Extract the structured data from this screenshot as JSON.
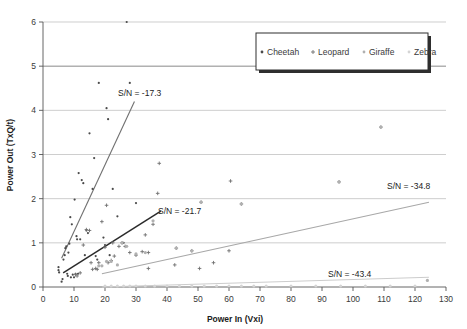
{
  "chart_data": {
    "type": "scatter",
    "title": "",
    "xlabel": "Power In (Vxi)",
    "ylabel": "Power Out (TxQ/t)",
    "xlim": [
      0,
      130
    ],
    "ylim": [
      0,
      6
    ],
    "xticks": [
      0,
      10,
      20,
      30,
      40,
      50,
      60,
      70,
      80,
      90,
      100,
      110,
      120,
      130
    ],
    "yticks": [
      0,
      1,
      2,
      3,
      4,
      5,
      6
    ],
    "grid": "horizontal",
    "legend_position": "top-right",
    "legend_entries": [
      "Cheetah",
      "Leopard",
      "Giraffe",
      "Zebra"
    ],
    "series": [
      {
        "name": "Cheetah",
        "color": "#4a4a4a",
        "marker": "dot",
        "points": [
          [
            5.0,
            0.38
          ],
          [
            5.0,
            0.45
          ],
          [
            5.2,
            0.33
          ],
          [
            6.0,
            0.12
          ],
          [
            6.3,
            0.18
          ],
          [
            6.6,
            0.62
          ],
          [
            7.0,
            0.72
          ],
          [
            7.2,
            0.88
          ],
          [
            7.5,
            0.92
          ],
          [
            7.8,
            0.3
          ],
          [
            8.0,
            0.25
          ],
          [
            8.2,
            0.78
          ],
          [
            8.5,
            0.98
          ],
          [
            8.8,
            1.58
          ],
          [
            9.0,
            0.22
          ],
          [
            9.3,
            1.42
          ],
          [
            9.6,
            0.28
          ],
          [
            10.0,
            0.22
          ],
          [
            10.2,
            1.98
          ],
          [
            10.5,
            0.3
          ],
          [
            10.8,
            1.15
          ],
          [
            11.0,
            1.08
          ],
          [
            11.3,
            0.3
          ],
          [
            11.5,
            2.58
          ],
          [
            12.0,
            1.08
          ],
          [
            12.5,
            2.42
          ],
          [
            13.0,
            2.35
          ],
          [
            13.5,
            0.72
          ],
          [
            14.0,
            1.28
          ],
          [
            14.5,
            1.22
          ],
          [
            15.0,
            3.48
          ],
          [
            16.0,
            2.22
          ],
          [
            16.5,
            2.92
          ],
          [
            17.0,
            0.7
          ],
          [
            17.5,
            0.62
          ],
          [
            18.0,
            4.62
          ],
          [
            19.5,
            1.12
          ],
          [
            20.0,
            0.95
          ],
          [
            20.5,
            4.05
          ],
          [
            21.0,
            3.8
          ],
          [
            21.5,
            0.72
          ],
          [
            22.5,
            2.22
          ],
          [
            24.0,
            1.6
          ],
          [
            26.0,
            1.0
          ],
          [
            27.0,
            6.0
          ],
          [
            28.0,
            4.62
          ],
          [
            30.0,
            1.9
          ]
        ]
      },
      {
        "name": "Leopard",
        "color": "#6f6f6f",
        "marker": "cross",
        "points": [
          [
            10.5,
            0.28
          ],
          [
            11.0,
            0.25
          ],
          [
            12.0,
            0.32
          ],
          [
            13.0,
            0.95
          ],
          [
            14.0,
            1.3
          ],
          [
            15.0,
            1.28
          ],
          [
            15.5,
            0.55
          ],
          [
            16.0,
            0.4
          ],
          [
            17.0,
            0.42
          ],
          [
            17.5,
            0.4
          ],
          [
            18.0,
            0.55
          ],
          [
            19.0,
            1.48
          ],
          [
            20.0,
            0.9
          ],
          [
            20.5,
            1.85
          ],
          [
            21.0,
            0.55
          ],
          [
            22.0,
            0.6
          ],
          [
            22.5,
            1.0
          ],
          [
            23.0,
            0.7
          ],
          [
            24.5,
            0.92
          ],
          [
            25.5,
            1.0
          ],
          [
            26.5,
            0.92
          ],
          [
            28.0,
            0.78
          ],
          [
            30.0,
            0.72
          ],
          [
            32.0,
            0.8
          ],
          [
            33.0,
            1.18
          ],
          [
            34.0,
            0.78
          ],
          [
            35.5,
            1.42
          ],
          [
            37.0,
            2.12
          ],
          [
            37.5,
            2.8
          ],
          [
            34.0,
            0.42
          ],
          [
            42.5,
            0.5
          ],
          [
            43.0,
            0.88
          ],
          [
            48.0,
            0.82
          ],
          [
            50.5,
            0.42
          ],
          [
            51.0,
            1.92
          ],
          [
            55.0,
            0.55
          ],
          [
            60.0,
            0.82
          ],
          [
            60.5,
            2.4
          ],
          [
            64.0,
            1.88
          ],
          [
            95.5,
            2.38
          ],
          [
            109.0,
            3.62
          ]
        ]
      },
      {
        "name": "Giraffe",
        "color": "#b0b0b0",
        "marker": "dot",
        "points": [
          [
            18.0,
            0.48
          ],
          [
            19.0,
            0.48
          ],
          [
            20.5,
            0.58
          ],
          [
            22.0,
            0.58
          ],
          [
            24.0,
            0.5
          ],
          [
            25.5,
            1.0
          ],
          [
            27.0,
            0.92
          ],
          [
            30.0,
            0.75
          ],
          [
            33.0,
            0.78
          ],
          [
            35.5,
            1.5
          ],
          [
            43.0,
            0.88
          ],
          [
            48.0,
            0.82
          ],
          [
            51.0,
            1.92
          ],
          [
            64.0,
            1.88
          ],
          [
            95.5,
            2.38
          ],
          [
            109.0,
            3.62
          ],
          [
            124.0,
            0.15
          ]
        ]
      },
      {
        "name": "Zebra",
        "color": "#d4d4d4",
        "marker": "dot",
        "points": [
          [
            20.0,
            0.02
          ],
          [
            22.0,
            0.02
          ],
          [
            24.0,
            0.02
          ],
          [
            26.0,
            0.02
          ],
          [
            28.0,
            0.02
          ],
          [
            30.0,
            0.02
          ],
          [
            33.0,
            0.02
          ],
          [
            36.0,
            0.02
          ],
          [
            40.0,
            0.02
          ],
          [
            44.0,
            0.02
          ],
          [
            48.0,
            0.02
          ],
          [
            52.0,
            0.02
          ],
          [
            56.0,
            0.02
          ],
          [
            60.0,
            0.02
          ],
          [
            64.0,
            0.02
          ],
          [
            68.0,
            0.02
          ],
          [
            72.0,
            0.02
          ],
          [
            80.0,
            0.02
          ],
          [
            88.0,
            0.02
          ],
          [
            96.0,
            0.02
          ],
          [
            104.0,
            0.02
          ],
          [
            112.0,
            0.02
          ],
          [
            120.0,
            0.02
          ]
        ]
      }
    ],
    "trendlines": [
      {
        "name": "Cheetah",
        "label": "S/N = -17.3",
        "color": "#707070",
        "x1": 6.0,
        "y1": 0.65,
        "x2": 29.5,
        "y2": 4.2,
        "label_x": 118,
        "label_y": 96
      },
      {
        "name": "Leopard",
        "label": "S/N = -21.7",
        "color": "#2b2b2b",
        "x1": 6.5,
        "y1": 0.32,
        "x2": 38.0,
        "y2": 1.72,
        "label_x": 158,
        "label_y": 214
      },
      {
        "name": "Giraffe",
        "label": "S/N = -34.8",
        "color": "#a8a8a8",
        "x1": 19.0,
        "y1": 0.3,
        "x2": 124.5,
        "y2": 1.92,
        "label_x": 387,
        "label_y": 189
      },
      {
        "name": "Zebra",
        "label": "S/N = -43.4",
        "color": "#cccccc",
        "x1": 19.0,
        "y1": 0.0,
        "x2": 124.5,
        "y2": 0.22,
        "label_x": 328,
        "label_y": 277
      }
    ]
  },
  "axes": {
    "x_title": "Power In (Vxi)",
    "y_title": "Power Out (TxQ/t)",
    "x_tick_labels": [
      "0",
      "10",
      "20",
      "30",
      "40",
      "50",
      "60",
      "70",
      "80",
      "90",
      "100",
      "110",
      "120",
      "130"
    ],
    "y_tick_labels": [
      "0",
      "1",
      "2",
      "3",
      "4",
      "5",
      "6"
    ]
  },
  "legend": {
    "items": [
      {
        "label": "Cheetah",
        "color": "#4a4a4a",
        "marker": "dot"
      },
      {
        "label": "Leopard",
        "color": "#6f6f6f",
        "marker": "cross"
      },
      {
        "label": "Giraffe",
        "color": "#b0b0b0",
        "marker": "dot"
      },
      {
        "label": "Zebra",
        "color": "#d4d4d4",
        "marker": "dot"
      }
    ]
  },
  "annotations": [
    {
      "text": "S/N = -17.3"
    },
    {
      "text": "S/N = -21.7"
    },
    {
      "text": "S/N = -34.8"
    },
    {
      "text": "S/N = -43.4"
    }
  ],
  "colors": {
    "cheetah": "#4a4a4a",
    "leopard": "#6f6f6f",
    "giraffe": "#b0b0b0",
    "zebra": "#d4d4d4",
    "grid": "#b9b9b9",
    "axis": "#555555",
    "background": "#ffffff"
  }
}
